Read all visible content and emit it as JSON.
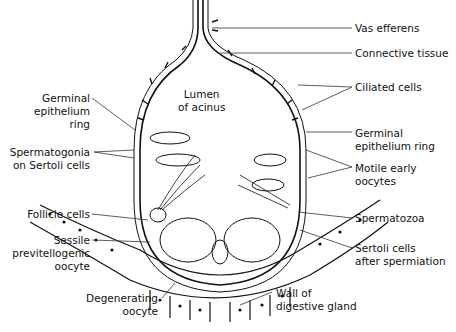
{
  "figure": {
    "type": "anatomical-diagram",
    "center_label": {
      "line1": "Lumen",
      "line2": "of acinus"
    }
  },
  "labels_right": [
    {
      "id": "vas-efferens",
      "line1": "Vas efferens",
      "line2": ""
    },
    {
      "id": "connective-tissue",
      "line1": "Connective tissue",
      "line2": ""
    },
    {
      "id": "ciliated-cells",
      "line1": "Ciliated cells",
      "line2": ""
    },
    {
      "id": "germinal-epithelium-ring-right",
      "line1": "Germinal",
      "line2": "epithelium ring"
    },
    {
      "id": "motile-early-oocytes",
      "line1": "Motile early",
      "line2": "oocytes"
    },
    {
      "id": "spermatozoa",
      "line1": "Spermatozoa",
      "line2": ""
    },
    {
      "id": "sertoli-after-spermiation",
      "line1": "Sertoli cells",
      "line2": "after spermiation"
    },
    {
      "id": "wall-digestive-gland",
      "line1": "Wall of",
      "line2": "digestive gland"
    }
  ],
  "labels_left": [
    {
      "id": "germinal-epithelium-ring-left",
      "line1": "Germinal",
      "line2": "epithelium",
      "line3": "ring"
    },
    {
      "id": "spermatogonia",
      "line1": "Spermatogonia",
      "line2": "on Sertoli cells"
    },
    {
      "id": "follicle-cells",
      "line1": "Follicle cells"
    },
    {
      "id": "sessile-oocyte",
      "line1": "Sessile",
      "line2": "previtellogenic",
      "line3": "oocyte"
    },
    {
      "id": "degenerating-oocyte",
      "line1": "Degenerating",
      "line2": "oocyte"
    }
  ]
}
